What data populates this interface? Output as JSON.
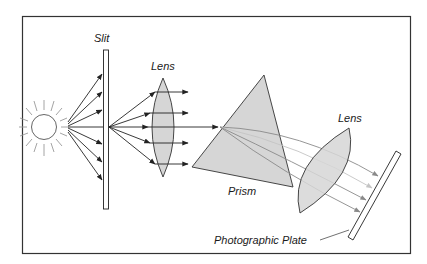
{
  "diagram": {
    "labels": {
      "slit": "Slit",
      "lens1": "Lens",
      "prism": "Prism",
      "lens2": "Lens",
      "plate": "Photographic Plate"
    },
    "components": [
      "Light source (sun)",
      "Slit",
      "Lens",
      "Prism",
      "Lens",
      "Photographic Plate"
    ],
    "colors": {
      "frame": "#333333",
      "line": "#222222",
      "fill_gray": "#d6d6d6",
      "dispersed_ray": "#8a8a8a",
      "light_ray": "#bdbdbd",
      "sun_rays": "#9a9a9a"
    }
  }
}
